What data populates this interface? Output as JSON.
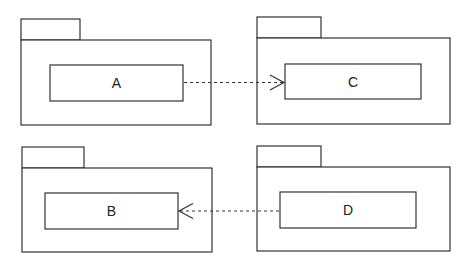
{
  "diagram": {
    "type": "UML package diagram",
    "packages": [
      {
        "id": "pkg-1",
        "tab": {
          "x": 21,
          "y": 19,
          "w": 59,
          "h": 21
        },
        "body": {
          "x": 21,
          "y": 40,
          "w": 190,
          "h": 85
        },
        "element": {
          "label": "A",
          "x": 50,
          "y": 65,
          "w": 133,
          "h": 36
        }
      },
      {
        "id": "pkg-2",
        "tab": {
          "x": 257,
          "y": 17,
          "w": 64,
          "h": 21
        },
        "body": {
          "x": 257,
          "y": 38,
          "w": 193,
          "h": 86
        },
        "element": {
          "label": "C",
          "x": 285,
          "y": 64,
          "w": 136,
          "h": 35
        }
      },
      {
        "id": "pkg-3",
        "tab": {
          "x": 22,
          "y": 147,
          "w": 62,
          "h": 21
        },
        "body": {
          "x": 22,
          "y": 168,
          "w": 190,
          "h": 84
        },
        "element": {
          "label": "B",
          "x": 45,
          "y": 193,
          "w": 133,
          "h": 36
        }
      },
      {
        "id": "pkg-4",
        "tab": {
          "x": 257,
          "y": 146,
          "w": 64,
          "h": 21
        },
        "body": {
          "x": 257,
          "y": 167,
          "w": 193,
          "h": 84
        },
        "element": {
          "label": "D",
          "x": 280,
          "y": 192,
          "w": 136,
          "h": 36
        }
      }
    ],
    "dependencies": [
      {
        "from": "A",
        "to": "C",
        "style": "dashed",
        "arrowhead": "open"
      },
      {
        "from": "D",
        "to": "B",
        "style": "dashed",
        "arrowhead": "open"
      }
    ],
    "colors": {
      "stroke": "#333333",
      "background": "#ffffff"
    }
  }
}
